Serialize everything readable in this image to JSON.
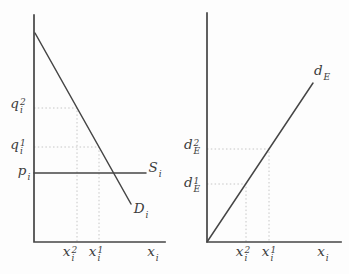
{
  "colors": {
    "background": "#fdfdfd",
    "line": "#454545",
    "guide": "#c6c6c6",
    "text": "#3c3c3c"
  },
  "chart_data": [
    {
      "type": "line",
      "panel": "left",
      "title": "",
      "xlabel": "x_i",
      "curves": [
        {
          "name": "demand",
          "label": "D_i",
          "slope": "negative",
          "from_y_axis": true
        },
        {
          "name": "supply",
          "label": "S_i",
          "slope": "zero",
          "level": "p_i"
        }
      ],
      "y_axis_marks": [
        "q_i^2",
        "q_i^1",
        "p_i"
      ],
      "x_axis_marks": [
        "x_i^2",
        "x_i^1"
      ],
      "grid": "dotted guides from q_i^2 and q_i^1 to demand curve, dropping to x_i^2 and x_i^1"
    },
    {
      "type": "line",
      "panel": "right",
      "title": "",
      "xlabel": "x_i",
      "curves": [
        {
          "name": "export-demand",
          "label": "d_E",
          "slope": "positive",
          "through": "origin"
        }
      ],
      "y_axis_marks": [
        "d_E^2",
        "d_E^1"
      ],
      "x_axis_marks": [
        "x_i^2",
        "x_i^1"
      ],
      "grid": "dotted guides from d_E^2 and d_E^1 to the d_E line, dropping to x_i^1 and x_i^2"
    }
  ],
  "panels": {
    "left": {
      "axis": {
        "origin": [
          34,
          242
        ],
        "y_top": 15,
        "x_end": 165
      },
      "curves": [
        {
          "name": "demand-curve",
          "points": [
            [
              35,
              33
            ],
            [
              131,
              204
            ]
          ]
        },
        {
          "name": "supply-curve",
          "points": [
            [
              34,
              173
            ],
            [
              146,
              173
            ]
          ]
        }
      ],
      "guides": [
        {
          "name": "q2-guide",
          "points": [
            [
              34,
              108
            ],
            [
              77,
              108
            ],
            [
              77,
              242
            ]
          ]
        },
        {
          "name": "q1-guide",
          "points": [
            [
              34,
              147
            ],
            [
              99,
              147
            ],
            [
              99,
              242
            ]
          ]
        }
      ],
      "labels": {
        "q2": {
          "base": "q",
          "sup": "2",
          "sub": "i"
        },
        "q1": {
          "base": "q",
          "sup": "1",
          "sub": "i"
        },
        "p": {
          "base": "p",
          "sup": "",
          "sub": "i"
        },
        "S": {
          "base": "S",
          "sup": "",
          "sub": "i"
        },
        "D": {
          "base": "D",
          "sup": "",
          "sub": "i"
        },
        "x2": {
          "base": "x",
          "sup": "2",
          "sub": "i"
        },
        "x1": {
          "base": "x",
          "sup": "1",
          "sub": "i"
        },
        "x": {
          "base": "x",
          "sup": "",
          "sub": "i"
        }
      }
    },
    "right": {
      "axis": {
        "origin": [
          207,
          242
        ],
        "y_top": 13,
        "x_end": 341
      },
      "curves": [
        {
          "name": "export-demand-curve",
          "points": [
            [
              207,
              242
            ],
            [
              313,
              83
            ]
          ]
        }
      ],
      "guides": [
        {
          "name": "d2-guide",
          "points": [
            [
              207,
              149
            ],
            [
              269,
              149
            ],
            [
              269,
              242
            ]
          ]
        },
        {
          "name": "d1-guide",
          "points": [
            [
              207,
              184
            ],
            [
              246,
              184
            ],
            [
              246,
              242
            ]
          ]
        }
      ],
      "labels": {
        "d2": {
          "base": "d",
          "sup": "2",
          "sub": "E"
        },
        "d1": {
          "base": "d",
          "sup": "1",
          "sub": "E"
        },
        "dE": {
          "base": "d",
          "sup": "",
          "sub": "E"
        },
        "x2": {
          "base": "x",
          "sup": "2",
          "sub": "i"
        },
        "x1": {
          "base": "x",
          "sup": "1",
          "sub": "i"
        },
        "x": {
          "base": "x",
          "sup": "",
          "sub": "i"
        }
      }
    }
  }
}
